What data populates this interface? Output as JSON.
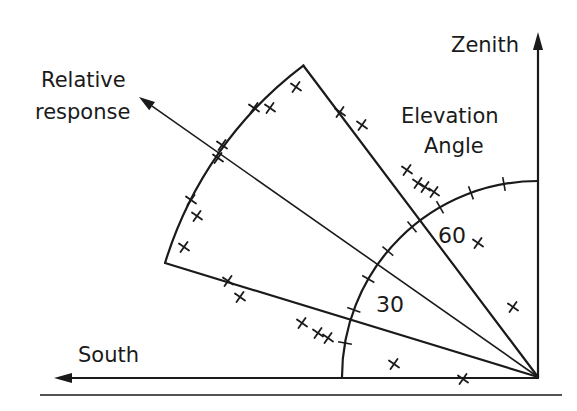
{
  "diagram": {
    "labels": {
      "zenith": "Zenith",
      "elevation_line1": "Elevation",
      "elevation_line2": "Angle",
      "relative_line1": "Relative",
      "relative_line2": "response",
      "south": "South",
      "tick30": "30",
      "tick60": "60"
    },
    "origin": [
      538,
      377
    ],
    "elevation_arc": {
      "radius": 196,
      "tick_step_deg": 10,
      "ticks_deg": [
        10,
        20,
        30,
        40,
        50,
        60,
        70,
        80
      ]
    },
    "response_sector": {
      "outer_radius": 390,
      "edge_angles_deg": [
        17,
        53
      ],
      "center_arrow_deg": 35,
      "top_corner": [
        303,
        63
      ],
      "bottom_corner": [
        167,
        263
      ],
      "arrow_tip": [
        139,
        97
      ]
    },
    "measurement_marks": [
      [
        296,
        87
      ],
      [
        254,
        108
      ],
      [
        270,
        108
      ],
      [
        340,
        112
      ],
      [
        362,
        125
      ],
      [
        222,
        145
      ],
      [
        218,
        158
      ],
      [
        191,
        200
      ],
      [
        197,
        216
      ],
      [
        184,
        247
      ],
      [
        228,
        281
      ],
      [
        240,
        297
      ],
      [
        407,
        170
      ],
      [
        418,
        183
      ],
      [
        425,
        187
      ],
      [
        434,
        192
      ],
      [
        478,
        243
      ],
      [
        513,
        307
      ],
      [
        302,
        323
      ],
      [
        318,
        333
      ],
      [
        328,
        338
      ],
      [
        394,
        364
      ],
      [
        463,
        379
      ]
    ],
    "colors": {
      "ink": "#1a1a1a",
      "background": "#ffffff"
    }
  }
}
